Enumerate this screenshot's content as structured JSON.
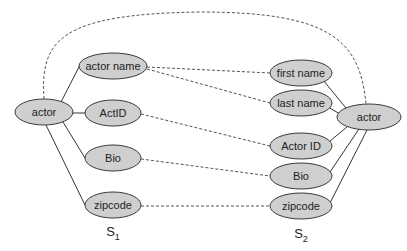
{
  "diagram": {
    "type": "schema-matching-graph",
    "colors": {
      "node_fill": "#cfcfcf",
      "node_stroke": "#3a3a3a",
      "edge": "#333333",
      "match_edge": "#555555"
    },
    "schema1": {
      "label_main": "S",
      "label_sub": "1",
      "root": {
        "id": "s1-actor",
        "label": "actor"
      },
      "attributes": [
        {
          "id": "s1-actor-name",
          "label": "actor name"
        },
        {
          "id": "s1-actid",
          "label": "ActID"
        },
        {
          "id": "s1-bio",
          "label": "Bio"
        },
        {
          "id": "s1-zipcode",
          "label": "zipcode"
        }
      ]
    },
    "schema2": {
      "label_main": "S",
      "label_sub": "2",
      "root": {
        "id": "s2-actor",
        "label": "actor"
      },
      "attributes": [
        {
          "id": "s2-first-name",
          "label": "first name"
        },
        {
          "id": "s2-last-name",
          "label": "last name"
        },
        {
          "id": "s2-actor-id",
          "label": "Actor ID"
        },
        {
          "id": "s2-bio",
          "label": "Bio"
        },
        {
          "id": "s2-zipcode",
          "label": "zipcode"
        }
      ]
    },
    "matches": [
      {
        "from": "s1-actor",
        "to": "s2-actor"
      },
      {
        "from": "s1-actor-name",
        "to": "s2-first-name"
      },
      {
        "from": "s1-actor-name",
        "to": "s2-last-name"
      },
      {
        "from": "s1-actid",
        "to": "s2-actor-id"
      },
      {
        "from": "s1-bio",
        "to": "s2-bio"
      },
      {
        "from": "s1-zipcode",
        "to": "s2-zipcode"
      }
    ]
  }
}
